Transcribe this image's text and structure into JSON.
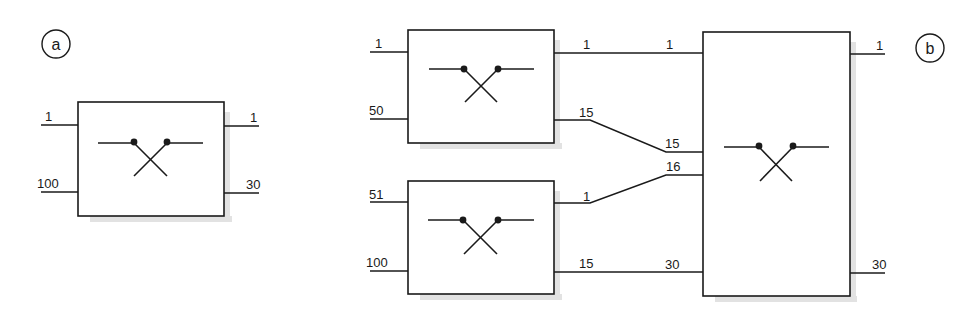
{
  "panels": {
    "a": {
      "label": "a",
      "block": {
        "inputs": [
          "1",
          "100"
        ],
        "outputs": [
          "1",
          "30"
        ]
      }
    },
    "b": {
      "label": "b",
      "block_top": {
        "inputs": [
          "1",
          "50"
        ],
        "outputs": [
          "1",
          "15"
        ]
      },
      "block_bottom": {
        "inputs": [
          "51",
          "100"
        ],
        "outputs": [
          "1",
          "15"
        ]
      },
      "block_merge": {
        "inputs": [
          "1",
          "15",
          "16",
          "30"
        ],
        "outputs": [
          "1",
          "30"
        ]
      }
    }
  },
  "colors": {
    "ink": "#1a1a1a",
    "shadow": "#e2e2e2",
    "background": "#ffffff"
  }
}
